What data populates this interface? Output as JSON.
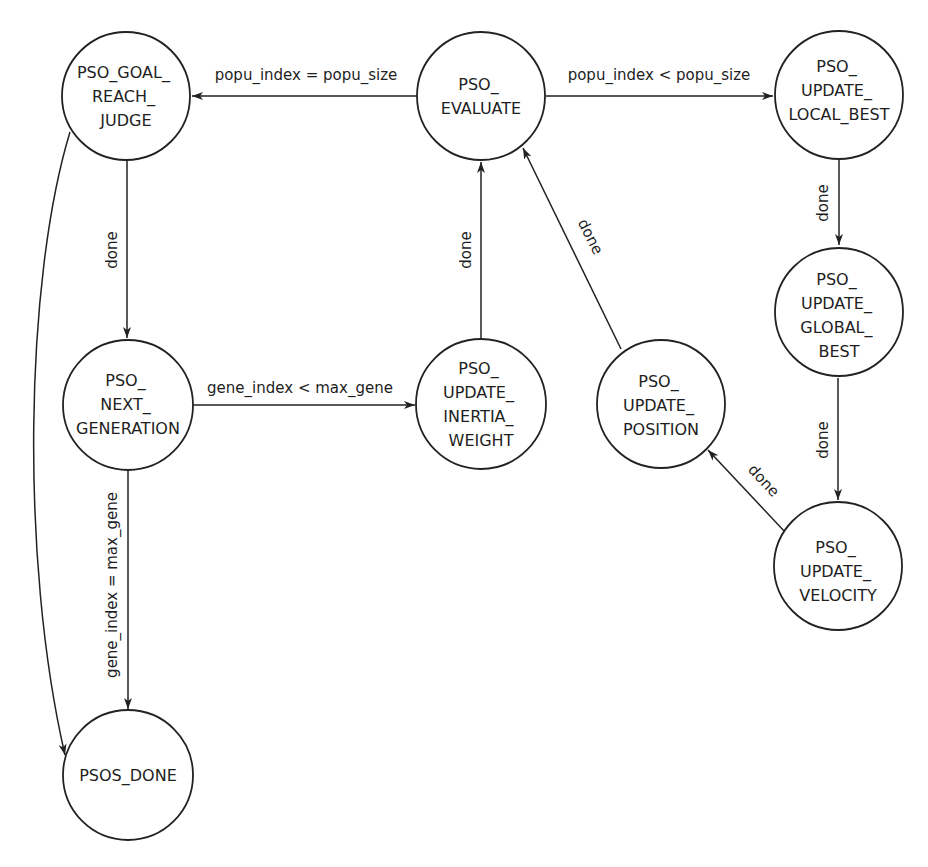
{
  "diagram": {
    "type": "state-machine",
    "colors": {
      "stroke": "#222222",
      "text": "#1e1e1e",
      "background": "#ffffff"
    },
    "states": {
      "goal_reach_judge": {
        "id": "PSO_GOAL_REACH_JUDGE",
        "lines": [
          "PSO_GOAL_",
          "REACH_",
          "JUDGE"
        ]
      },
      "evaluate": {
        "id": "PSO_EVALUATE",
        "lines": [
          "PSO_",
          "EVALUATE"
        ]
      },
      "update_local_best": {
        "id": "PSO_UPDATE_LOCAL_BEST",
        "lines": [
          "PSO_",
          "UPDATE_",
          "LOCAL_BEST"
        ]
      },
      "update_global_best": {
        "id": "PSO_UPDATE_GLOBAL_BEST",
        "lines": [
          "PSO_",
          "UPDATE_",
          "GLOBAL_",
          "BEST"
        ]
      },
      "next_generation": {
        "id": "PSO_NEXT_GENERATION",
        "lines": [
          "PSO_",
          "NEXT_",
          "GENERATION"
        ]
      },
      "update_inertia_weight": {
        "id": "PSO_UPDATE_INERTIA_WEIGHT",
        "lines": [
          "PSO_",
          "UPDATE_",
          "INERTIA_",
          "WEIGHT"
        ]
      },
      "update_position": {
        "id": "PSO_UPDATE_POSITION",
        "lines": [
          "PSO_",
          "UPDATE_",
          "POSITION"
        ]
      },
      "update_velocity": {
        "id": "PSO_UPDATE_VELOCITY",
        "lines": [
          "PSO_",
          "UPDATE_",
          "VELOCITY"
        ]
      },
      "done": {
        "id": "PSOS_DONE",
        "lines": [
          "PSOS_DONE"
        ]
      }
    },
    "transitions": {
      "evaluate_to_goal": {
        "from": "PSO_EVALUATE",
        "to": "PSO_GOAL_REACH_JUDGE",
        "label": "popu_index = popu_size"
      },
      "evaluate_to_local": {
        "from": "PSO_EVALUATE",
        "to": "PSO_UPDATE_LOCAL_BEST",
        "label": "popu_index < popu_size"
      },
      "goal_to_nextgen": {
        "from": "PSO_GOAL_REACH_JUDGE",
        "to": "PSO_NEXT_GENERATION",
        "label": "done"
      },
      "goal_to_done": {
        "from": "PSO_GOAL_REACH_JUDGE",
        "to": "PSOS_DONE",
        "label": ""
      },
      "nextgen_to_inertia": {
        "from": "PSO_NEXT_GENERATION",
        "to": "PSO_UPDATE_INERTIA_WEIGHT",
        "label": "gene_index < max_gene"
      },
      "nextgen_to_done": {
        "from": "PSO_NEXT_GENERATION",
        "to": "PSOS_DONE",
        "label": "gene_index = max_gene"
      },
      "inertia_to_evaluate": {
        "from": "PSO_UPDATE_INERTIA_WEIGHT",
        "to": "PSO_EVALUATE",
        "label": "done"
      },
      "position_to_evaluate": {
        "from": "PSO_UPDATE_POSITION",
        "to": "PSO_EVALUATE",
        "label": "done"
      },
      "local_to_global": {
        "from": "PSO_UPDATE_LOCAL_BEST",
        "to": "PSO_UPDATE_GLOBAL_BEST",
        "label": "done"
      },
      "global_to_velocity": {
        "from": "PSO_UPDATE_GLOBAL_BEST",
        "to": "PSO_UPDATE_VELOCITY",
        "label": "done"
      },
      "velocity_to_position": {
        "from": "PSO_UPDATE_VELOCITY",
        "to": "PSO_UPDATE_POSITION",
        "label": "done"
      }
    }
  }
}
